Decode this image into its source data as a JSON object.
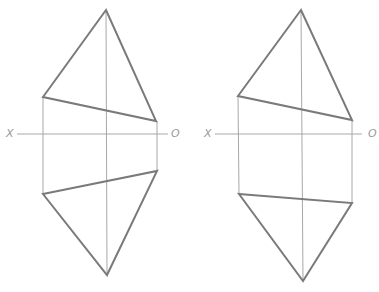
{
  "diagram": {
    "type": "orthographic-projection",
    "colors": {
      "background": "#ffffff",
      "thin_line": "#a8a8a8",
      "outline": "#7a7a7a",
      "label": "#9a9a9a"
    },
    "figures": [
      {
        "name": "left-projection",
        "axis": {
          "y": 134,
          "x1": 17,
          "x2": 168,
          "left_label": "X",
          "right_label": "O"
        },
        "top_view": {
          "apex": [
            106,
            10
          ],
          "left": [
            43,
            97
          ],
          "right": [
            156,
            121
          ]
        },
        "bottom_view": {
          "left": [
            43,
            194
          ],
          "right": [
            157,
            171
          ],
          "apex": [
            107,
            275
          ]
        },
        "centerline_x": 106
      },
      {
        "name": "right-projection",
        "axis": {
          "y": 134,
          "x1": 215,
          "x2": 362,
          "left_label": "X",
          "right_label": "O"
        },
        "top_view": {
          "apex": [
            301,
            10
          ],
          "left": [
            238,
            96
          ],
          "right": [
            352,
            120
          ]
        },
        "bottom_view": {
          "left": [
            239,
            194
          ],
          "right": [
            352,
            203
          ],
          "apex": [
            303,
            281
          ]
        },
        "centerline_x": 302
      }
    ]
  }
}
